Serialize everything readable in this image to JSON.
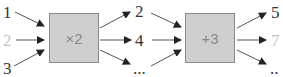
{
  "diagram": {
    "inputs": [
      {
        "label": "1",
        "faded": false
      },
      {
        "label": "2",
        "faded": true
      },
      {
        "label": "3",
        "faded": false
      }
    ],
    "operator1": {
      "label": "×2"
    },
    "middle": [
      {
        "label": "2",
        "faded": false
      },
      {
        "label": "4",
        "faded": false
      },
      {
        "label": "...",
        "faded": false
      }
    ],
    "operator2": {
      "label": "+3"
    },
    "outputs": [
      {
        "label": "5",
        "faded": false
      },
      {
        "label": "7",
        "faded": true
      },
      {
        "label": "..",
        "faded": false
      }
    ],
    "colors": {
      "box_fill": "#cfcfcf",
      "box_border": "#8a8a8a",
      "text": "#333333",
      "faded_text": "#c4c4c4",
      "arrow": "#333333"
    }
  }
}
